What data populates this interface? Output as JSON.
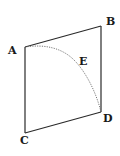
{
  "diagram": {
    "type": "geometric-figure",
    "colors": {
      "stroke": "#2a2a2a",
      "curve": "#6a6a6a",
      "text": "#1a1a1a",
      "background": "#ffffff"
    },
    "vertices": {
      "A": {
        "label": "A",
        "x": 25,
        "y": 47
      },
      "B": {
        "label": "B",
        "x": 101,
        "y": 26
      },
      "D": {
        "label": "D",
        "x": 101,
        "y": 112
      },
      "C": {
        "label": "C",
        "x": 25,
        "y": 133
      }
    },
    "curve": {
      "label": "E",
      "from": "A",
      "to": "D",
      "style": "dotted"
    },
    "edges": [
      [
        "A",
        "B"
      ],
      [
        "B",
        "D"
      ],
      [
        "D",
        "C"
      ],
      [
        "C",
        "A"
      ]
    ]
  }
}
